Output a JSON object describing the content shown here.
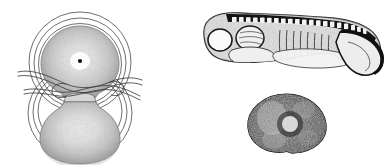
{
  "plate": {
    "background_color": "#ffffff",
    "ink_color": "#1a1a1a",
    "line_color": "#444444",
    "stipple_color": "#3d3d3d",
    "width": 391,
    "height": 165,
    "style": "pen-and-ink stipple scientific illustration",
    "caption": "",
    "figures": [
      {
        "id": "constricted-egg",
        "label": "",
        "name": "constricted-egg-figure",
        "description": "Amphibian egg constricted into two lobes by a fine hair loop, surrounded by concentric jelly-coat rings",
        "bbox": {
          "x": 8,
          "y": 4,
          "width": 145,
          "height": 157
        },
        "parts": [
          {
            "name": "upper-blastomere",
            "note": "stippled dome with dark nuclear dot and pale halo"
          },
          {
            "name": "lower-blastomere",
            "note": "stippled dome, slightly paler center"
          },
          {
            "name": "constriction-waist",
            "note": "narrow neck joining the two lobes"
          },
          {
            "name": "hair-ligature",
            "note": "looped thread tied around the waist, ends extending left and right"
          },
          {
            "name": "jelly-coat-rings",
            "note": "three concentric outlines around each lobe"
          },
          {
            "name": "nucleus-dot",
            "note": "small dark dot in the upper lobe"
          }
        ],
        "ring_count": 3
      },
      {
        "id": "tailbud-larva",
        "label": "",
        "name": "tailbud-larva-figure",
        "description": "Lateral view of a tailbud-stage amphibian larva with segmented dorsal somites and a downward-curving tail",
        "bbox": {
          "x": 185,
          "y": 8,
          "width": 200,
          "height": 72
        },
        "parts": [
          {
            "name": "head",
            "note": "rounded anterior with eye vesicle"
          },
          {
            "name": "eye-vesicle",
            "note": "pale circular lobe at the front"
          },
          {
            "name": "otic-vesicle",
            "note": "second pale lobe behind the eye"
          },
          {
            "name": "gill-region",
            "note": "striated pale mass beneath the head"
          },
          {
            "name": "somite-band",
            "note": "dark dorsal band with regular pale rectangular blocks"
          },
          {
            "name": "myotomes",
            "note": "vertical striations along the trunk"
          },
          {
            "name": "yolk-mass",
            "note": "pale ventral bulge"
          },
          {
            "name": "tail",
            "note": "tapering fin curving downward, dark dorsal margin"
          }
        ],
        "somite_count": 22
      },
      {
        "id": "pigmented-blastula",
        "label": "",
        "name": "pigmented-blastula-figure",
        "description": "Darkly pigmented rounded embryo half with a pale central region",
        "bbox": {
          "x": 243,
          "y": 92,
          "width": 90,
          "height": 62
        },
        "parts": [
          {
            "name": "pigmented-rim",
            "note": "dense dark stippled border"
          },
          {
            "name": "pale-center",
            "note": "light circular area near the middle"
          },
          {
            "name": "surface-mottling",
            "note": "irregular light and dark patches"
          }
        ]
      }
    ]
  }
}
